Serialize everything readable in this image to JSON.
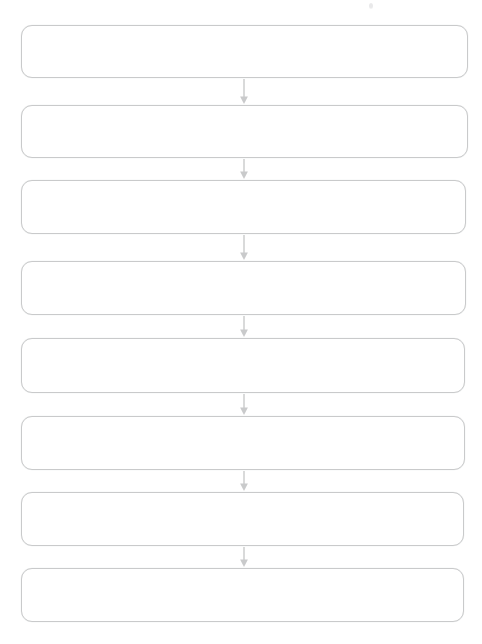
{
  "diagram": {
    "type": "vertical-flowchart",
    "orientation": "top-to-bottom",
    "background_color": "#ffffff",
    "node_border_color": "#c9cacb",
    "node_fill_color": "#ffffff",
    "arrow_color": "#c9cacb",
    "node_count": 8,
    "arrow_count": 7,
    "nodes": [
      {
        "id": "node-1",
        "label": "",
        "x": 21,
        "y": 25,
        "width": 447,
        "height": 53
      },
      {
        "id": "node-2",
        "label": "",
        "x": 21,
        "y": 105,
        "width": 447,
        "height": 53
      },
      {
        "id": "node-3",
        "label": "",
        "x": 21,
        "y": 180,
        "width": 445,
        "height": 54
      },
      {
        "id": "node-4",
        "label": "",
        "x": 21,
        "y": 261,
        "width": 445,
        "height": 54
      },
      {
        "id": "node-5",
        "label": "",
        "x": 21,
        "y": 338,
        "width": 444,
        "height": 55
      },
      {
        "id": "node-6",
        "label": "",
        "x": 21,
        "y": 416,
        "width": 444,
        "height": 54
      },
      {
        "id": "node-7",
        "label": "",
        "x": 21,
        "y": 492,
        "width": 443,
        "height": 54
      },
      {
        "id": "node-8",
        "label": "",
        "x": 21,
        "y": 568,
        "width": 443,
        "height": 54
      }
    ],
    "arrows": [
      {
        "id": "arrow-1-2",
        "from": "node-1",
        "to": "node-2",
        "x": 237,
        "y": 79,
        "length": 25
      },
      {
        "id": "arrow-2-3",
        "from": "node-2",
        "to": "node-3",
        "x": 237,
        "y": 159,
        "length": 20
      },
      {
        "id": "arrow-3-4",
        "from": "node-3",
        "to": "node-4",
        "x": 237,
        "y": 235,
        "length": 25
      },
      {
        "id": "arrow-4-5",
        "from": "node-4",
        "to": "node-5",
        "x": 237,
        "y": 316,
        "length": 21
      },
      {
        "id": "arrow-5-6",
        "from": "node-5",
        "to": "node-6",
        "x": 237,
        "y": 394,
        "length": 21
      },
      {
        "id": "arrow-6-7",
        "from": "node-6",
        "to": "node-7",
        "x": 237,
        "y": 471,
        "length": 20
      },
      {
        "id": "arrow-7-8",
        "from": "node-7",
        "to": "node-8",
        "x": 237,
        "y": 547,
        "length": 20
      }
    ],
    "artifacts": [
      {
        "id": "speck-1",
        "type": "scan-speck",
        "x": 369,
        "y": 3
      }
    ]
  }
}
